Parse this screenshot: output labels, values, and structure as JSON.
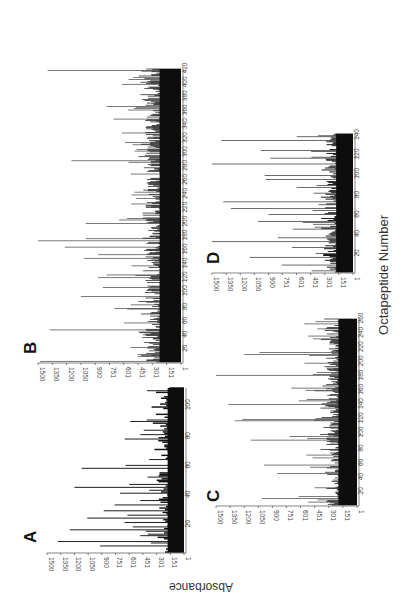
{
  "figure": {
    "ylabel": "Absorbance",
    "xlabel": "Octapeptide Number",
    "orientation": "rotated-90"
  },
  "chart_data": [
    {
      "type": "bar",
      "panel": "A",
      "title": "A",
      "xlabel": "Octapeptide Number",
      "ylabel": "Absorbance",
      "ylim": [
        1,
        1500
      ],
      "xlim": [
        1,
        113
      ],
      "y_ticks": [
        "1",
        "151",
        "301",
        "451",
        "601",
        "751",
        "900",
        "1050",
        "1200",
        "1350",
        "1500"
      ],
      "x_ticks": [
        "20",
        "40",
        "60",
        "80",
        "100"
      ],
      "baseline_level": 200,
      "peaks": [
        [
          5,
          920
        ],
        [
          8,
          1380
        ],
        [
          12,
          480
        ],
        [
          16,
          1250
        ],
        [
          18,
          560
        ],
        [
          21,
          650
        ],
        [
          24,
          1060
        ],
        [
          26,
          620
        ],
        [
          29,
          880
        ],
        [
          33,
          760
        ],
        [
          36,
          480
        ],
        [
          41,
          700
        ],
        [
          45,
          1200
        ],
        [
          47,
          600
        ],
        [
          52,
          400
        ],
        [
          58,
          1120
        ],
        [
          60,
          640
        ],
        [
          78,
          650
        ],
        [
          81,
          480
        ],
        [
          90,
          590
        ]
      ]
    },
    {
      "type": "bar",
      "panel": "B",
      "title": "B",
      "xlabel": "Octapeptide Number",
      "ylabel": "Absorbance",
      "ylim": [
        1,
        1500
      ],
      "xlim": [
        1,
        422
      ],
      "y_ticks": [
        "1",
        "151",
        "301",
        "451",
        "601",
        "751",
        "900",
        "1050",
        "1200",
        "1350",
        "1500"
      ],
      "x_ticks": [
        "20",
        "40",
        "60",
        "80",
        "100",
        "120",
        "140",
        "160",
        "180",
        "200",
        "220",
        "240",
        "260",
        "280",
        "300",
        "320",
        "340",
        "360",
        "380",
        "400",
        "420"
      ],
      "baseline_level": 250,
      "peaks": [
        [
          2,
          1480
        ],
        [
          10,
          420
        ],
        [
          22,
          530
        ],
        [
          47,
          1380
        ],
        [
          57,
          600
        ],
        [
          78,
          700
        ],
        [
          95,
          1050
        ],
        [
          108,
          820
        ],
        [
          122,
          870
        ],
        [
          126,
          780
        ],
        [
          150,
          1020
        ],
        [
          155,
          870
        ],
        [
          166,
          1220
        ],
        [
          175,
          1500
        ],
        [
          178,
          1000
        ],
        [
          200,
          1000
        ],
        [
          205,
          650
        ],
        [
          290,
          1150
        ],
        [
          330,
          620
        ],
        [
          350,
          710
        ],
        [
          368,
          780
        ],
        [
          400,
          620
        ],
        [
          420,
          1400
        ]
      ]
    },
    {
      "type": "bar",
      "panel": "C",
      "title": "C",
      "xlabel": "Octapeptide Number",
      "ylabel": "Absorbance",
      "ylim": [
        1,
        1500
      ],
      "xlim": [
        1,
        262
      ],
      "y_ticks": [
        "1",
        "151",
        "301",
        "451",
        "601",
        "751",
        "900",
        "1050",
        "1200",
        "1350",
        "1500"
      ],
      "x_ticks": [
        "20",
        "40",
        "60",
        "80",
        "100",
        "120",
        "140",
        "160",
        "180",
        "200",
        "220",
        "240",
        "260"
      ],
      "baseline_level": 220,
      "peaks": [
        [
          5,
          520
        ],
        [
          10,
          1010
        ],
        [
          13,
          620
        ],
        [
          45,
          850
        ],
        [
          57,
          990
        ],
        [
          71,
          540
        ],
        [
          92,
          1130
        ],
        [
          97,
          720
        ],
        [
          119,
          1300
        ],
        [
          121,
          1220
        ],
        [
          142,
          1370
        ],
        [
          147,
          620
        ],
        [
          165,
          700
        ],
        [
          183,
          1500
        ],
        [
          200,
          560
        ],
        [
          212,
          1200
        ],
        [
          215,
          1040
        ],
        [
          238,
          520
        ],
        [
          255,
          560
        ]
      ]
    },
    {
      "type": "bar",
      "panel": "D",
      "title": "D",
      "xlabel": "Octapeptide Number",
      "ylabel": "Absorbance",
      "ylim": [
        1,
        1500
      ],
      "xlim": [
        1,
        143
      ],
      "y_ticks": [
        "1",
        "151",
        "301",
        "451",
        "601",
        "751",
        "900",
        "1050",
        "1200",
        "1350",
        "1500"
      ],
      "x_ticks": [
        "20",
        "40",
        "60",
        "80",
        "100",
        "120",
        "140"
      ],
      "baseline_level": 200,
      "peaks": [
        [
          8,
          760
        ],
        [
          16,
          1100
        ],
        [
          26,
          650
        ],
        [
          32,
          1500
        ],
        [
          36,
          800
        ],
        [
          45,
          640
        ],
        [
          53,
          1010
        ],
        [
          60,
          900
        ],
        [
          66,
          1300
        ],
        [
          73,
          1380
        ],
        [
          82,
          420
        ],
        [
          88,
          600
        ],
        [
          96,
          930
        ],
        [
          100,
          940
        ],
        [
          112,
          1500
        ],
        [
          118,
          880
        ],
        [
          126,
          980
        ],
        [
          136,
          1400
        ],
        [
          140,
          600
        ]
      ]
    }
  ]
}
